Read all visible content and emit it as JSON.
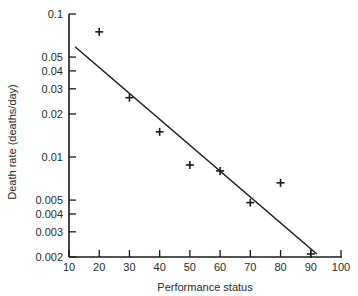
{
  "chart_data": {
    "type": "scatter",
    "title": "",
    "xlabel": "Performance status",
    "ylabel": "Death rate (deaths/day)",
    "xlim": [
      10,
      100
    ],
    "ylim": [
      0.002,
      0.1
    ],
    "yscale": "log",
    "grid": false,
    "legend": null,
    "x_ticks": [
      10,
      20,
      30,
      40,
      50,
      60,
      70,
      80,
      90,
      100
    ],
    "x_tick_labels": [
      "10",
      "20",
      "30",
      "40",
      "50",
      "60",
      "70",
      "80",
      "90",
      "100"
    ],
    "y_ticks": [
      0.1,
      0.05,
      0.04,
      0.03,
      0.02,
      0.01,
      0.005,
      0.004,
      0.003,
      0.002
    ],
    "y_tick_labels": [
      "0.1",
      "0.05",
      "0.04",
      "0.03",
      "0.02",
      "0.01",
      "0.005",
      "0.004",
      "0.003",
      "0.002"
    ],
    "series": [
      {
        "name": "observed",
        "marker": "+",
        "x": [
          20,
          30,
          40,
          50,
          60,
          70,
          80,
          90
        ],
        "y": [
          0.075,
          0.026,
          0.015,
          0.0088,
          0.008,
          0.0048,
          0.0066,
          0.0021
        ]
      },
      {
        "name": "regression line",
        "style": "line",
        "x": [
          12,
          92
        ],
        "y": [
          0.059,
          0.0021
        ]
      }
    ],
    "colors": {
      "ink": "#1a1a1a",
      "background": "#ffffff"
    }
  }
}
